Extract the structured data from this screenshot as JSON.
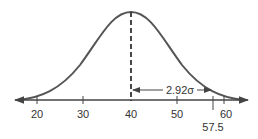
{
  "diagram": {
    "type": "normal-distribution-curve",
    "mean": 40,
    "marked_value": 57.5,
    "distance_label": "2.92σ",
    "axis_ticks": [
      "20",
      "30",
      "40",
      "50",
      "60"
    ],
    "marked_label": "57.5",
    "colors": {
      "curve": "#555555",
      "axis": "#444444",
      "text": "#333333"
    }
  }
}
